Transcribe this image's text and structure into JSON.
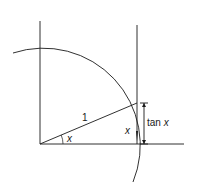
{
  "diagram": {
    "labels": {
      "radius": "1",
      "angle_at_origin": "x",
      "angle_at_tangent": "x",
      "tangent_prefix": "tan ",
      "tangent_var": "x"
    },
    "colors": {
      "stroke": "#1a1a1a",
      "background": "#ffffff"
    }
  }
}
